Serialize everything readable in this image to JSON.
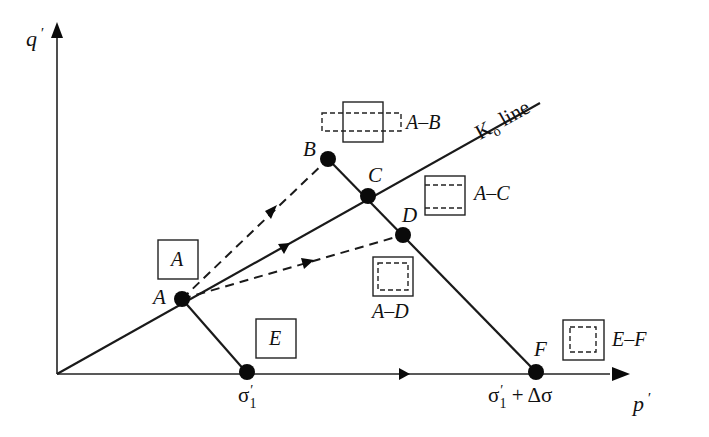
{
  "axes": {
    "y_label": "q",
    "y_prime": "′",
    "x_label": "p",
    "x_prime": "′"
  },
  "k0_line": {
    "label_k": "K",
    "label_sub": "o",
    "label_rest": " line"
  },
  "points": {
    "A": "A",
    "B": "B",
    "C": "C",
    "D": "D",
    "E": "E",
    "F": "F"
  },
  "boxes": {
    "A_box": "A",
    "E_box": "E",
    "AB": "A–B",
    "AC": "A–C",
    "AD": "A–D",
    "EF": "E–F"
  },
  "x_ticks": {
    "sigma1": "σ",
    "sigma1_prime": "′",
    "sigma1_sub": "1",
    "sigma1_delta_main": "σ",
    "sigma1_delta_prime": "′",
    "sigma1_delta_sub": "1",
    "sigma1_delta_rest": " + Δσ"
  },
  "colors": {
    "ink": "#1a1a1a",
    "background": "#ffffff"
  }
}
